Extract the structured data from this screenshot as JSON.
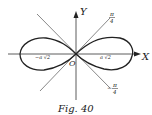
{
  "figure": {
    "caption": "Fig. 40",
    "axis_x_label": "X",
    "axis_y_label": "Y",
    "origin_label": "O",
    "left_vertex_label": "−a √2",
    "right_vertex_label": "a √2",
    "tangent_upper_label_num": "π",
    "tangent_upper_label_den": "4",
    "tangent_lower_label_sign": "−",
    "tangent_lower_label_num": "π",
    "tangent_lower_label_den": "4",
    "curve": "lemniscate",
    "colors": {
      "ink": "#222222",
      "background": "#ffffff"
    }
  }
}
